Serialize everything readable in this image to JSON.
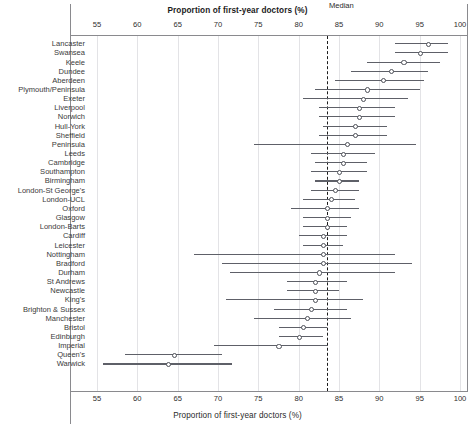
{
  "chart": {
    "type": "forest-plot",
    "title_top": "Proportion of first-year doctors (%)",
    "title_bottom": "Proportion of first-year doctors (%)",
    "median_label": "Median",
    "median_value": 83.5,
    "accent_color": "#5e6068",
    "grid_color": "#e3e3e6",
    "axis_color": "#8a8a8e"
  },
  "chart_data": {
    "type": "scatter",
    "title": "Proportion of first-year doctors (%)",
    "xlabel": "Proportion of first-year doctors (%)",
    "ylabel": "",
    "xlim": [
      55,
      100
    ],
    "xticks": [
      55,
      60,
      65,
      70,
      75,
      80,
      85,
      90,
      95,
      100
    ],
    "grid": true,
    "legend": "none",
    "annotations": [
      {
        "text": "Median",
        "x": 83.5,
        "type": "vline-dashed"
      }
    ],
    "categories": [
      "Lancaster",
      "Swansea",
      "Keele",
      "Dundee",
      "Aberdeen",
      "Plymouth/Peninsula",
      "Exeter",
      "Liverpool",
      "Norwich",
      "Hull-York",
      "Sheffield",
      "Peninsula",
      "Leeds",
      "Cambridge",
      "Southampton",
      "Birmingham",
      "London-St George's",
      "London-UCL",
      "Oxford",
      "Glasgow",
      "London-Barts",
      "Cardiff",
      "Leicester",
      "Nottingham",
      "Bradford",
      "Durham",
      "St Andrews",
      "Newcastle",
      "King's",
      "Brighton & Sussex",
      "Manchester",
      "Bristol",
      "Edinburgh",
      "Imperial",
      "Queen's",
      "Warwick"
    ],
    "values": [
      96.0,
      95.0,
      93.0,
      91.5,
      90.5,
      88.5,
      88.0,
      87.5,
      87.5,
      87.0,
      87.0,
      86.0,
      85.5,
      85.5,
      85.0,
      85.0,
      84.5,
      84.0,
      83.5,
      83.5,
      83.5,
      83.0,
      83.0,
      83.0,
      83.0,
      82.5,
      82.0,
      82.0,
      82.0,
      81.5,
      81.0,
      80.5,
      80.0,
      77.5,
      64.5,
      63.8
    ],
    "ci_low": [
      92.0,
      92.0,
      88.5,
      86.5,
      84.5,
      82.0,
      80.5,
      82.5,
      82.5,
      83.0,
      82.5,
      74.5,
      81.5,
      82.0,
      81.5,
      82.0,
      81.5,
      80.5,
      79.0,
      80.5,
      80.5,
      80.0,
      80.5,
      67.0,
      70.5,
      71.5,
      78.5,
      78.5,
      71.0,
      77.0,
      74.5,
      77.5,
      77.5,
      69.5,
      58.5,
      55.8
    ],
    "ci_high": [
      98.5,
      98.5,
      97.5,
      96.0,
      95.5,
      95.0,
      93.5,
      92.0,
      92.0,
      91.0,
      91.0,
      94.5,
      89.5,
      88.5,
      88.5,
      87.5,
      87.5,
      87.0,
      87.5,
      86.5,
      86.0,
      86.0,
      85.5,
      92.0,
      94.0,
      92.0,
      86.0,
      85.0,
      88.0,
      86.0,
      86.5,
      83.5,
      83.0,
      83.5,
      70.5,
      71.7
    ]
  }
}
